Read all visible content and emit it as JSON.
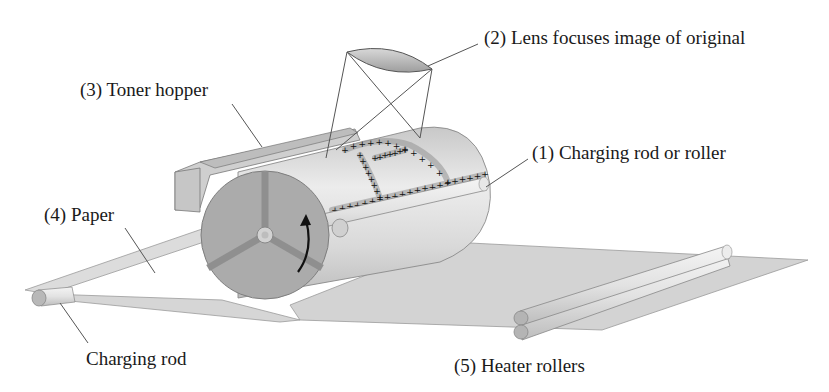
{
  "diagram": {
    "labels": {
      "lens": "(2) Lens focuses image of original",
      "toner_hopper": "(3) Toner hopper",
      "charging_roller": "(1) Charging rod or roller",
      "paper": "(4) Paper",
      "charging_rod": "Charging rod",
      "heater_rollers": "(5) Heater rollers"
    },
    "charge_symbol": "+",
    "rotation_indicator": "curved-arrow",
    "colors": {
      "drum_end": "#a9a9a9",
      "drum_body": "#d8d8d8",
      "paper": "#d0d0d0",
      "roller": "#e0e0e0",
      "lens": "#b5b5b5",
      "line": "#555555",
      "text": "#1a1a1a"
    }
  }
}
